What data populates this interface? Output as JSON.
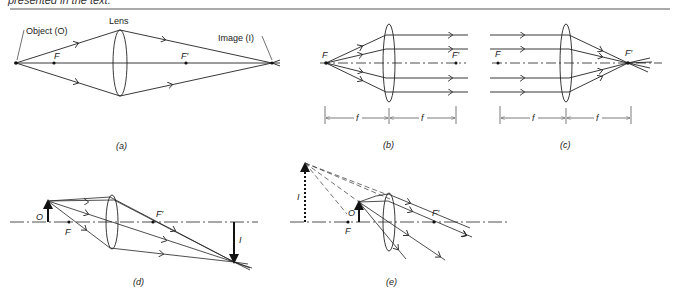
{
  "header": {
    "caption_fragment": "presented in the text."
  },
  "colors": {
    "ink": "#222222",
    "background": "#ffffff"
  },
  "panels": {
    "a": {
      "label": "(a)",
      "object_label": "Object (O)",
      "lens_label": "Lens",
      "focal_near": "F",
      "focal_far": "F′",
      "image_label": "Image (I)"
    },
    "b": {
      "label": "(b)",
      "focal_near": "F",
      "focal_far": "F′",
      "dim_left": "f",
      "dim_right": "f"
    },
    "c": {
      "label": "(c)",
      "focal_near": "F",
      "focal_far": "F′",
      "dim_left": "f",
      "dim_right": "f"
    },
    "d": {
      "label": "(d)",
      "object": "O",
      "focal_near": "F",
      "focal_far": "F′",
      "image": "I"
    },
    "e": {
      "label": "(e)",
      "object": "O",
      "focal_near": "F",
      "focal_far": "F′",
      "image": "I"
    }
  }
}
